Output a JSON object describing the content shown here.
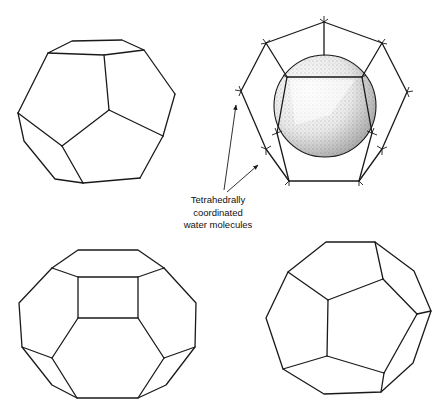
{
  "figure": {
    "annotation": {
      "lines": [
        "Tetrahedrally",
        "coordinated",
        "water molecules"
      ]
    },
    "panels": [
      {
        "position": "top-left",
        "shape": "pentagonal dodecahedron"
      },
      {
        "position": "top-right",
        "shape": "dodecahedron cage with guest sphere"
      },
      {
        "position": "bottom-left",
        "shape": "tetrakaidecahedron"
      },
      {
        "position": "bottom-right",
        "shape": "pentagonal dodecahedron"
      }
    ]
  },
  "colors": {
    "line": "#1a1a1a",
    "background": "#ffffff"
  }
}
